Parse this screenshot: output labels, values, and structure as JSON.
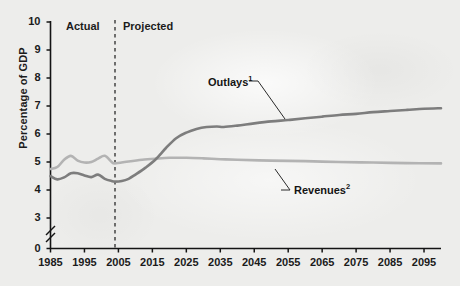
{
  "chart_data": {
    "type": "line",
    "title": "",
    "xlabel": "",
    "ylabel": "Percentage of GDP",
    "xlim": [
      1985,
      2100
    ],
    "ylim": [
      3,
      10
    ],
    "y_axis_break": true,
    "y_axis_break_note": "axis broken between 0 and 3",
    "grid": false,
    "legend_position": "inline-annotations",
    "xticks": [
      "1985",
      "1995",
      "2005",
      "2015",
      "2025",
      "2035",
      "2045",
      "2055",
      "2065",
      "2075",
      "2085",
      "2095"
    ],
    "yticks": [
      "0",
      "3",
      "4",
      "5",
      "6",
      "7",
      "8",
      "9",
      "10"
    ],
    "annotations": [
      {
        "text": "Actual",
        "superscript": "",
        "x_year": 1994
      },
      {
        "text": "Projected",
        "superscript": "",
        "x_year": 2013
      },
      {
        "text": "Outlays",
        "superscript": "1",
        "x_year": 2043
      },
      {
        "text": "Revenues",
        "superscript": "2",
        "x_year": 2052
      }
    ],
    "divider": {
      "x_year": 2004,
      "style": "dashed",
      "label_left": "Actual",
      "label_right": "Projected"
    },
    "series": [
      {
        "name": "Outlays",
        "superscript": "1",
        "color": "#7d7d7d",
        "x": [
          1985,
          1987,
          1989,
          1991,
          1993,
          1995,
          1997,
          1999,
          2001,
          2003,
          2004,
          2006,
          2008,
          2010,
          2013,
          2016,
          2019,
          2022,
          2025,
          2028,
          2031,
          2034,
          2036,
          2040,
          2045,
          2050,
          2055,
          2060,
          2065,
          2070,
          2075,
          2080,
          2085,
          2090,
          2095,
          2100
        ],
        "values": [
          4.5,
          4.38,
          4.45,
          4.6,
          4.6,
          4.52,
          4.46,
          4.55,
          4.4,
          4.32,
          4.3,
          4.32,
          4.4,
          4.55,
          4.8,
          5.1,
          5.5,
          5.85,
          6.05,
          6.18,
          6.25,
          6.27,
          6.25,
          6.3,
          6.38,
          6.45,
          6.5,
          6.56,
          6.62,
          6.68,
          6.72,
          6.78,
          6.82,
          6.86,
          6.9,
          6.92
        ]
      },
      {
        "name": "Revenues",
        "superscript": "2",
        "color": "#b3b3b3",
        "x": [
          1985,
          1987,
          1989,
          1991,
          1993,
          1995,
          1997,
          1999,
          2001,
          2003,
          2004,
          2008,
          2012,
          2016,
          2020,
          2025,
          2030,
          2035,
          2040,
          2050,
          2060,
          2070,
          2080,
          2090,
          2100
        ],
        "values": [
          4.75,
          4.82,
          5.08,
          5.22,
          5.05,
          4.98,
          5.0,
          5.12,
          5.22,
          5.0,
          4.95,
          5.02,
          5.08,
          5.12,
          5.15,
          5.15,
          5.13,
          5.1,
          5.08,
          5.05,
          5.03,
          5.0,
          4.98,
          4.96,
          4.95
        ]
      }
    ]
  },
  "axis": {
    "y_title": "Percentage of GDP",
    "y_ticks": [
      "10",
      "9",
      "8",
      "7",
      "6",
      "5",
      "4",
      "3",
      "0"
    ],
    "x_ticks": [
      "1985",
      "1995",
      "2005",
      "2015",
      "2025",
      "2035",
      "2045",
      "2055",
      "2065",
      "2075",
      "2085",
      "2095"
    ]
  },
  "labels": {
    "actual": "Actual",
    "projected": "Projected",
    "outlays": "Outlays",
    "outlays_sup": "1",
    "revenues": "Revenues",
    "revenues_sup": "2"
  },
  "colors": {
    "background": "#ededeb",
    "axis": "#141414",
    "outlays_line": "#7d7d7d",
    "revenues_line": "#b3b3b3",
    "text": "#1b1b1b"
  }
}
